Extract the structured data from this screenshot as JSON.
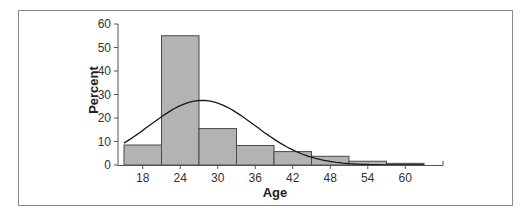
{
  "chart_data": {
    "type": "bar",
    "subtype": "histogram_with_normal_curve",
    "title": "",
    "xlabel": "Age",
    "ylabel": "Percent",
    "categories": [
      "18",
      "24",
      "30",
      "36",
      "42",
      "48",
      "54",
      "60"
    ],
    "bin_edges": [
      15,
      21,
      27,
      33,
      39,
      45,
      51,
      57,
      63
    ],
    "values": [
      8.5,
      55,
      15.5,
      8.3,
      5.7,
      3.7,
      1.6,
      0.7
    ],
    "ylim": [
      0,
      60
    ],
    "yticks": [
      0,
      10,
      20,
      30,
      40,
      50,
      60
    ],
    "xticks": [
      18,
      24,
      30,
      36,
      42,
      48,
      54,
      60
    ],
    "xlim": [
      15,
      66
    ],
    "grid": false,
    "legend": null,
    "overlay": {
      "type": "line",
      "name": "Normal curve",
      "mean": 27.5,
      "peak": 27.5,
      "sd": 8.5
    },
    "colors": {
      "bar_fill": "#b3b3b3",
      "bar_stroke": "#4a4a4a",
      "curve": "#1a1a1a",
      "axis": "#555555"
    }
  }
}
